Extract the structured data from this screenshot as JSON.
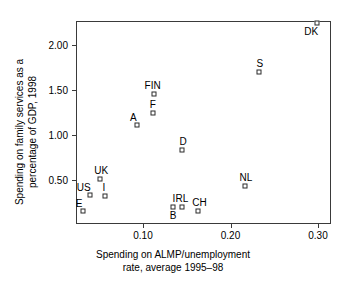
{
  "chart_data": {
    "type": "scatter",
    "title": "",
    "xlabel": "Spending on ALMP/unemployment rate, average 1995–98",
    "xlabel_lines": [
      "Spending on ALMP/unemployment",
      "rate, average 1995–98"
    ],
    "ylabel": "Spending on family services as a percentage of GDP, 1998",
    "ylabel_lines": [
      "Spending on family services as a",
      "percentage of GDP, 1998"
    ],
    "xlim": [
      0.024,
      0.315
    ],
    "ylim": [
      0.07,
      2.3
    ],
    "grid": false,
    "legend": null,
    "xticks": [
      0.1,
      0.2,
      0.3
    ],
    "xticklabels": [
      "0.10",
      "0.20",
      "0.30"
    ],
    "yticks": [
      0.5,
      1.0,
      1.5,
      2.0
    ],
    "yticklabels": [
      "0.50",
      "1.00",
      "1.50",
      "2.00"
    ],
    "marker": "open-square",
    "points": [
      {
        "label": "DK",
        "x": 0.299,
        "y": 2.25,
        "label_pos": "below-left"
      },
      {
        "label": "S",
        "x": 0.233,
        "y": 1.7,
        "label_pos": "above"
      },
      {
        "label": "FIN",
        "x": 0.112,
        "y": 1.455,
        "label_pos": "above"
      },
      {
        "label": "F",
        "x": 0.111,
        "y": 1.25,
        "label_pos": "above"
      },
      {
        "label": "A",
        "x": 0.093,
        "y": 1.11,
        "label_pos": "above-left"
      },
      {
        "label": "D",
        "x": 0.145,
        "y": 0.83,
        "label_pos": "above"
      },
      {
        "label": "NL",
        "x": 0.217,
        "y": 0.435,
        "label_pos": "above"
      },
      {
        "label": "UK",
        "x": 0.051,
        "y": 0.51,
        "label_pos": "above"
      },
      {
        "label": "US",
        "x": 0.039,
        "y": 0.33,
        "label_pos": "above-left"
      },
      {
        "label": "I",
        "x": 0.057,
        "y": 0.325,
        "label_pos": "above"
      },
      {
        "label": "E",
        "x": 0.031,
        "y": 0.155,
        "label_pos": "above-left"
      },
      {
        "label": "B",
        "x": 0.134,
        "y": 0.195,
        "label_pos": "below"
      },
      {
        "label": "IRL",
        "x": 0.144,
        "y": 0.195,
        "label_pos": "above"
      },
      {
        "label": "CH",
        "x": 0.163,
        "y": 0.16,
        "label_pos": "above"
      }
    ]
  },
  "style": {
    "axis_color": "#3a3a3a",
    "marker_edge_color": "#2b2b2b",
    "marker_face_color": "#ffffff",
    "background": "#ffffff",
    "text_color": "#000000"
  }
}
